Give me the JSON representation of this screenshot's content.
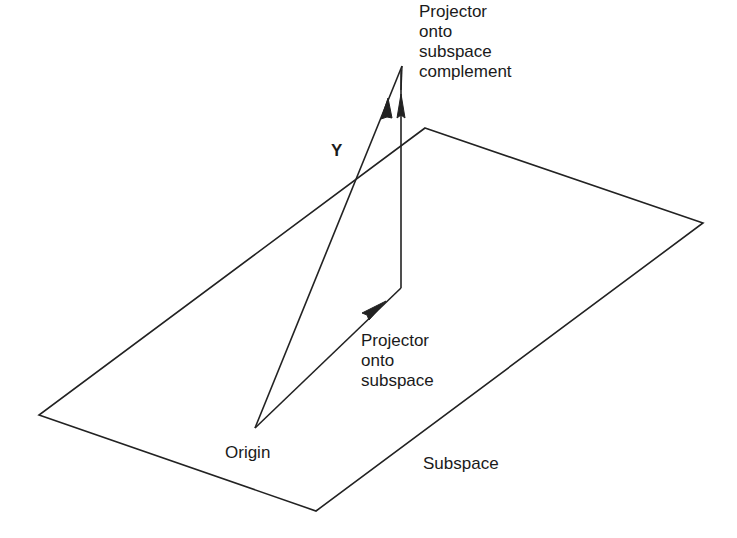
{
  "diagram": {
    "type": "vector-projection",
    "labels": {
      "y_vector": "Y",
      "complement_projector": "Projector\nonto\nsubspace\ncomplement",
      "subspace_projector": "Projector\nonto\nsubspace",
      "origin": "Origin",
      "subspace": "Subspace"
    },
    "colors": {
      "stroke": "#222222",
      "background": "#ffffff",
      "text": "#1a1a1a"
    },
    "geometry": {
      "plane": [
        [
          425,
          128
        ],
        [
          703,
          223
        ],
        [
          316,
          511
        ],
        [
          39,
          415
        ]
      ],
      "origin": [
        255,
        428
      ],
      "y_tip": [
        402,
        66
      ],
      "subspace_proj_end": [
        401,
        288
      ]
    }
  }
}
